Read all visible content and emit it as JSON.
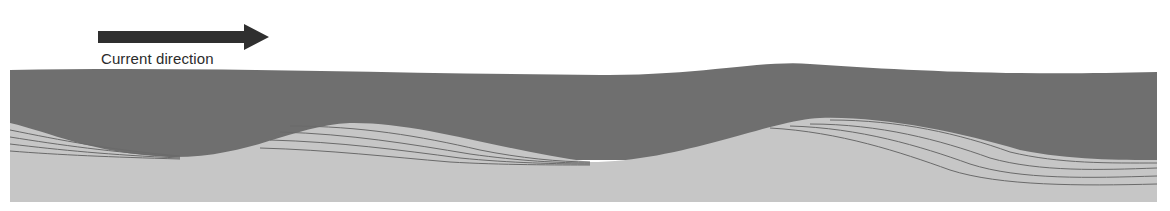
{
  "legend": {
    "arrow_label": "Current direction",
    "arrow_icon": "right-arrow-icon"
  },
  "colors": {
    "water": "#6f6f6f",
    "sediment": "#c6c6c6",
    "bedding_line": "#6a6a6a",
    "arrow": "#2f2f2f",
    "background": "#ffffff"
  },
  "layers": [
    {
      "name": "water-current",
      "description": "flowing water layer (dark)"
    },
    {
      "name": "sediment-ripples",
      "description": "sand ripples with cross-bedding (light)"
    }
  ]
}
